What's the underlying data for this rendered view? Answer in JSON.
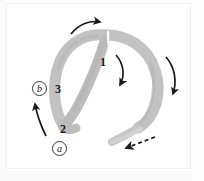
{
  "figure": {
    "background_color": "#ffffff",
    "band_color": "#c0c0c0",
    "band_color_dark": "#a8a8a8",
    "arrow_color": "#1a1a1a",
    "width": 204,
    "height": 181
  },
  "labels": {
    "point_1": "1",
    "point_2": "2",
    "point_3": "3",
    "marker_a": "a",
    "marker_b": "b"
  },
  "icons": {
    "arrow_top": "curved-arrow-right-icon",
    "arrow_inner": "curved-arrow-down-icon",
    "arrow_right": "curved-arrow-down-icon",
    "arrow_bottom_dashed": "dashed-arrow-down-left-icon",
    "arrow_left": "arrow-up-left-icon",
    "band": "gray-loop-band-shape"
  }
}
